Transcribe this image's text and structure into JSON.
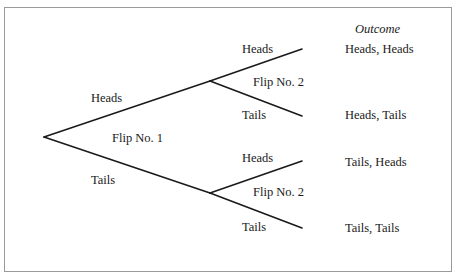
{
  "diagram": {
    "type": "probability-tree",
    "header": {
      "outcome": "Outcome"
    },
    "flip1": {
      "label": "Flip No. 1",
      "heads": "Heads",
      "tails": "Tails"
    },
    "flip2_upper": {
      "label": "Flip No. 2",
      "heads": "Heads",
      "tails": "Tails"
    },
    "flip2_lower": {
      "label": "Flip No. 2",
      "heads": "Heads",
      "tails": "Tails"
    },
    "outcomes": [
      "Heads, Heads",
      "Heads, Tails",
      "Tails, Heads",
      "Tails, Tails"
    ],
    "colors": {
      "line": "#1a1a1a",
      "frame": "#9a9a9a",
      "background": "#ffffff"
    }
  }
}
